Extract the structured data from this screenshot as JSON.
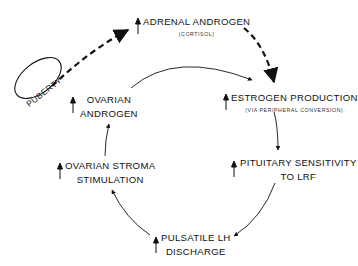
{
  "diagram": {
    "type": "cycle",
    "trigger": {
      "label": "PUBERTY",
      "shape": "ellipse"
    },
    "nodes": [
      {
        "id": "adrenal-androgen",
        "lines": [
          "ADRENAL ANDROGEN"
        ],
        "subtext": "(CORTISOL)",
        "increase_indicator": "up-arrow"
      },
      {
        "id": "estrogen-production",
        "lines": [
          "ESTROGEN PRODUCTION"
        ],
        "subtext": "(VIA PERIPHERAL CONVERSION)",
        "increase_indicator": "up-arrow"
      },
      {
        "id": "pituitary-sensitivity",
        "lines": [
          "PITUITARY SENSITIVITY",
          "TO LRF"
        ],
        "increase_indicator": "up-arrow"
      },
      {
        "id": "pulsatile-lh",
        "lines": [
          "PULSATILE LH",
          "DISCHARGE"
        ],
        "increase_indicator": "up-arrow"
      },
      {
        "id": "ovarian-stroma",
        "lines": [
          "OVARIAN STROMA",
          "STIMULATION"
        ],
        "increase_indicator": "up-arrow"
      },
      {
        "id": "ovarian-androgen",
        "lines": [
          "OVARIAN",
          "ANDROGEN"
        ],
        "increase_indicator": "up-arrow"
      }
    ],
    "edges": [
      {
        "from": "puberty",
        "to": "adrenal-androgen",
        "style": "dashed"
      },
      {
        "from": "adrenal-androgen",
        "to": "estrogen-production",
        "style": "dashed"
      },
      {
        "from": "ovarian-androgen",
        "to": "estrogen-production",
        "style": "solid"
      },
      {
        "from": "estrogen-production",
        "to": "pituitary-sensitivity",
        "style": "solid"
      },
      {
        "from": "pituitary-sensitivity",
        "to": "pulsatile-lh",
        "style": "solid"
      },
      {
        "from": "pulsatile-lh",
        "to": "ovarian-stroma",
        "style": "solid"
      },
      {
        "from": "ovarian-stroma",
        "to": "ovarian-androgen",
        "style": "solid"
      }
    ],
    "colors": {
      "ink": "#111111",
      "background": "#ffffff"
    }
  }
}
